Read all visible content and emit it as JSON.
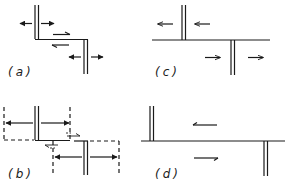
{
  "figure": {
    "stroke_color": "#1a1a1a",
    "background": "#ffffff"
  },
  "panels": [
    {
      "id": "a",
      "label": "(a)",
      "elements": [
        "upper double bar",
        "lower double bar",
        "step connecting line",
        "outward arrows at upper bar",
        "outward arrows at lower bar",
        "opposing half-arrows on connecting segment"
      ]
    },
    {
      "id": "b",
      "label": "(b)",
      "elements": [
        "upper double bar",
        "lower double bar",
        "dashed box upper",
        "dashed box lower",
        "outward arrows with dashed extents",
        "small half-arrows near connection"
      ]
    },
    {
      "id": "c",
      "label": "(c)",
      "elements": [
        "horizontal line",
        "upper double bar",
        "lower double bar",
        "left-pointing arrows above line",
        "right-pointing arrows below line"
      ]
    },
    {
      "id": "d",
      "label": "(d)",
      "elements": [
        "horizontal line",
        "upper-left double bar",
        "lower-right double bar",
        "left half-arrow above line",
        "right half-arrow below line"
      ]
    }
  ]
}
